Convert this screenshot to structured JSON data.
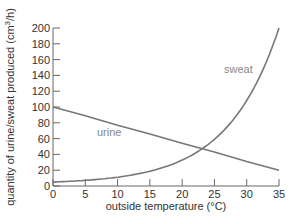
{
  "chart_data": {
    "type": "line",
    "title": "",
    "xlabel": "outside temperature (°C)",
    "ylabel": "quantity of urine/sweat produced (cm³/h)",
    "xlim": [
      0,
      35
    ],
    "ylim": [
      0,
      200
    ],
    "xticks": [
      0,
      5,
      10,
      15,
      20,
      25,
      30,
      35
    ],
    "yticks": [
      0,
      20,
      40,
      60,
      80,
      100,
      120,
      140,
      160,
      180,
      200
    ],
    "grid": false,
    "legend": "inline labels",
    "series": [
      {
        "name": "urine",
        "x": [
          0,
          5,
          10,
          15,
          20,
          25,
          30,
          35
        ],
        "values": [
          100,
          89,
          77,
          66,
          54,
          43,
          31,
          20
        ]
      },
      {
        "name": "sweat",
        "x": [
          0,
          5,
          10,
          15,
          20,
          22.5,
          25,
          27.5,
          30,
          32.5,
          35
        ],
        "values": [
          5,
          6,
          10,
          18,
          33,
          45,
          63,
          88,
          118,
          155,
          200
        ]
      }
    ]
  },
  "labels": {
    "xlabel": "outside temperature (°C)",
    "ylabel_main": "quantity of urine/sweat produced (cm",
    "ylabel_sup": "3",
    "ylabel_end": "/h)",
    "urine": "urine",
    "sweat": "sweat"
  }
}
